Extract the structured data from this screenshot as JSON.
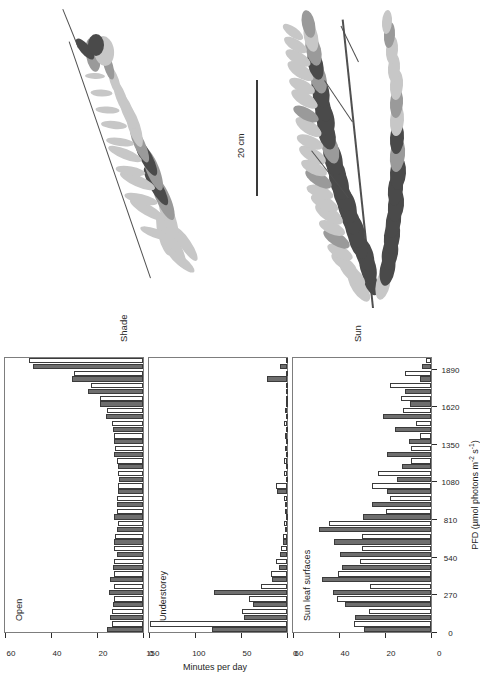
{
  "figure": {
    "orientation": "rotated-90",
    "colors": {
      "filled_bar": "#6e6e6e",
      "open_bar": "#ffffff",
      "bar_outline": "#3b3b3b",
      "axis": "#2b2b2b"
    }
  },
  "canopy": {
    "shade_label": "Shade",
    "sun_label": "Sun",
    "scalebar_label": "20 cm"
  },
  "chart_data": {
    "type": "bar",
    "title": "",
    "xlabel": "PFD (µmol photons m⁻² s⁻¹)",
    "ylabel": "Minutes per day",
    "xlabel_parts": {
      "main": "PFD (µmol photons m",
      "sup1": "-2",
      "mid": " s",
      "sup2": "-1",
      "tail": ")"
    },
    "xticks": [
      0,
      270,
      540,
      810,
      1080,
      1350,
      1620,
      1890
    ],
    "xlim": [
      0,
      1980
    ],
    "grid": false,
    "legend_position": "none",
    "series_names": [
      "filled",
      "open"
    ],
    "panels": [
      {
        "name": "Open",
        "ylim": [
          0,
          60
        ],
        "yticks": [
          0,
          20,
          40,
          60
        ],
        "categories": [
          45,
          135,
          225,
          315,
          405,
          495,
          585,
          675,
          765,
          855,
          945,
          1035,
          1125,
          1215,
          1305,
          1395,
          1485,
          1575,
          1665,
          1755,
          1845,
          1935
        ],
        "series": [
          {
            "name": "filled",
            "values": [
              15.5,
              14.5,
              13.0,
              15.0,
              14.5,
              13.0,
              11.5,
              12.5,
              11.5,
              12.5,
              11.5,
              11.0,
              10.5,
              11.0,
              12.5,
              12.5,
              13.0,
              16.0,
              18.5,
              24.0,
              31.0,
              48.0
            ]
          },
          {
            "name": "open",
            "values": [
              13.5,
              13.5,
              12.5,
              12.5,
              12.5,
              12.5,
              12.5,
              12.0,
              11.0,
              11.5,
              11.5,
              11.0,
              11.0,
              11.5,
              12.0,
              12.5,
              13.5,
              15.5,
              18.5,
              22.5,
              30.0,
              49.5
            ]
          }
        ]
      },
      {
        "name": "Understorey",
        "ylim": [
          0,
          150
        ],
        "yticks": [
          0,
          50,
          100,
          150
        ],
        "categories": [
          45,
          135,
          225,
          315,
          405,
          495,
          585,
          675,
          765,
          855,
          945,
          1035,
          1125,
          1215,
          1305,
          1395,
          1485,
          1575,
          1665,
          1755,
          1845,
          1935
        ],
        "series": [
          {
            "name": "filled",
            "values": [
              82.0,
              46.5,
              36.5,
              79.5,
              16.0,
              9.0,
              7.5,
              4.5,
              2.5,
              1.5,
              2.0,
              11.0,
              1.5,
              1.5,
              1.5,
              1.5,
              1.5,
              1.5,
              1.5,
              1.5,
              21.5,
              7.5
            ]
          },
          {
            "name": "open",
            "values": [
              149.0,
              48.5,
              41.0,
              28.5,
              17.0,
              11.5,
              7.0,
              4.5,
              3.0,
              2.0,
              3.0,
              12.5,
              3.5,
              3.0,
              2.5,
              2.0,
              3.0,
              2.0,
              1.5,
              1.5,
              1.5,
              1.5
            ]
          }
        ]
      },
      {
        "name": "Sun leaf surfaces",
        "ylim": [
          0,
          60
        ],
        "yticks": [
          0,
          20,
          40,
          60
        ],
        "categories": [
          45,
          135,
          225,
          315,
          405,
          495,
          585,
          675,
          765,
          855,
          945,
          1035,
          1125,
          1215,
          1305,
          1395,
          1485,
          1575,
          1665,
          1755,
          1845,
          1935
        ],
        "series": [
          {
            "name": "filled",
            "values": [
              29.0,
              33.0,
              37.5,
              42.5,
              47.5,
              38.5,
              39.5,
              42.0,
              48.5,
              29.5,
              25.5,
              19.0,
              15.0,
              12.5,
              19.0,
              9.5,
              15.5,
              21.0,
              9.0,
              11.5,
              5.0,
              4.0
            ]
          },
          {
            "name": "open",
            "values": [
              33.5,
              27.0,
              41.0,
              26.5,
              40.5,
              31.0,
              30.0,
              30.0,
              44.5,
              19.5,
              18.0,
              25.5,
              23.0,
              8.5,
              8.5,
              5.0,
              6.5,
              12.0,
              13.0,
              18.0,
              11.5,
              2.0
            ]
          }
        ]
      }
    ]
  }
}
